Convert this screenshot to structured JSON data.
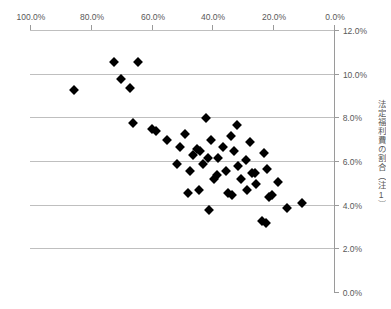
{
  "chart_data": {
    "type": "scatter",
    "title": "",
    "xlabel": "",
    "ylabel": "法定福利費の割合（注1）",
    "xlim": [
      0.0,
      100.0
    ],
    "ylim": [
      0.0,
      12.0
    ],
    "x_reversed": true,
    "y_reversed": true,
    "grid": true,
    "legend": null,
    "xticks": [
      "0.0%",
      "20.0%",
      "40.0%",
      "60.0%",
      "80.0%",
      "100.0%"
    ],
    "xtick_values": [
      0.0,
      20.0,
      40.0,
      60.0,
      80.0,
      100.0
    ],
    "yticks": [
      "0.0%",
      "2.0%",
      "4.0%",
      "6.0%",
      "8.0%",
      "10.0%",
      "12.0%"
    ],
    "ytick_values": [
      0.0,
      2.0,
      4.0,
      6.0,
      8.0,
      10.0,
      12.0
    ],
    "marker": "diamond",
    "marker_color": "#000000",
    "points": [
      {
        "x": 22.5,
        "y": 3.2
      },
      {
        "x": 23.8,
        "y": 3.3
      },
      {
        "x": 15.5,
        "y": 3.9
      },
      {
        "x": 41.0,
        "y": 3.8
      },
      {
        "x": 10.5,
        "y": 4.1
      },
      {
        "x": 21.5,
        "y": 4.4
      },
      {
        "x": 20.4,
        "y": 4.5
      },
      {
        "x": 33.5,
        "y": 4.5
      },
      {
        "x": 28.5,
        "y": 4.7
      },
      {
        "x": 35.0,
        "y": 4.6
      },
      {
        "x": 44.5,
        "y": 4.7
      },
      {
        "x": 48.0,
        "y": 4.6
      },
      {
        "x": 25.5,
        "y": 5.0
      },
      {
        "x": 18.5,
        "y": 5.1
      },
      {
        "x": 30.5,
        "y": 5.2
      },
      {
        "x": 39.5,
        "y": 5.2
      },
      {
        "x": 38.5,
        "y": 5.4
      },
      {
        "x": 26.0,
        "y": 5.5
      },
      {
        "x": 27.0,
        "y": 5.5
      },
      {
        "x": 35.5,
        "y": 5.6
      },
      {
        "x": 22.0,
        "y": 5.7
      },
      {
        "x": 47.5,
        "y": 5.6
      },
      {
        "x": 31.5,
        "y": 5.8
      },
      {
        "x": 43.0,
        "y": 5.9
      },
      {
        "x": 51.5,
        "y": 5.9
      },
      {
        "x": 29.0,
        "y": 6.1
      },
      {
        "x": 38.0,
        "y": 6.2
      },
      {
        "x": 41.5,
        "y": 6.2
      },
      {
        "x": 46.5,
        "y": 6.3
      },
      {
        "x": 23.0,
        "y": 6.4
      },
      {
        "x": 33.0,
        "y": 6.5
      },
      {
        "x": 44.0,
        "y": 6.5
      },
      {
        "x": 45.2,
        "y": 6.6
      },
      {
        "x": 36.5,
        "y": 6.7
      },
      {
        "x": 50.5,
        "y": 6.7
      },
      {
        "x": 27.5,
        "y": 6.9
      },
      {
        "x": 40.5,
        "y": 7.0
      },
      {
        "x": 55.0,
        "y": 7.0
      },
      {
        "x": 34.0,
        "y": 7.2
      },
      {
        "x": 49.0,
        "y": 7.3
      },
      {
        "x": 58.5,
        "y": 7.4
      },
      {
        "x": 60.0,
        "y": 7.5
      },
      {
        "x": 32.0,
        "y": 7.7
      },
      {
        "x": 66.0,
        "y": 7.8
      },
      {
        "x": 42.0,
        "y": 8.0
      },
      {
        "x": 85.5,
        "y": 9.3
      },
      {
        "x": 67.0,
        "y": 9.4
      },
      {
        "x": 70.0,
        "y": 9.8
      },
      {
        "x": 72.5,
        "y": 10.6
      },
      {
        "x": 64.5,
        "y": 10.6
      }
    ]
  },
  "axis": {
    "y_title": "法定福利費の割合（注1）",
    "y_title_chars": [
      "法",
      "定",
      "福",
      "利",
      "費",
      "の",
      "割",
      "合",
      "（",
      "注",
      "1",
      "）"
    ]
  }
}
